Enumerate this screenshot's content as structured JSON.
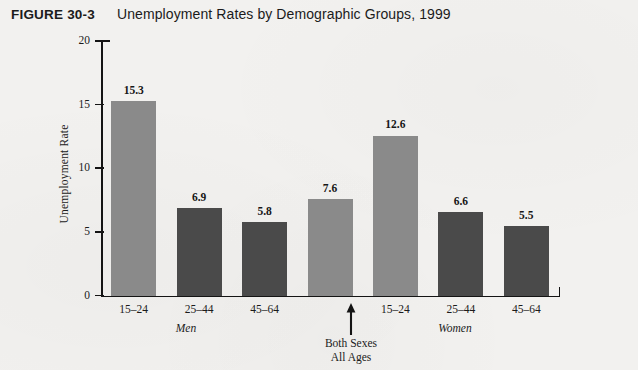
{
  "figure": {
    "number": "FIGURE 30-3",
    "title": "Unemployment Rates by Demographic Groups, 1999"
  },
  "colors": {
    "bar_light": "#8a8a8a",
    "bar_dark": "#4a4a4a",
    "axis": "#141414",
    "background": "#f2f1ef",
    "text": "#1b1b1b"
  },
  "chart_data": {
    "type": "bar",
    "title": "Unemployment Rates by Demographic Groups, 1999",
    "xlabel": "",
    "ylabel": "Unemployment Rate",
    "ylim": [
      0,
      20
    ],
    "yticks": [
      0,
      5,
      10,
      15,
      20
    ],
    "ytick_labels": [
      "0",
      "5",
      "10",
      "15",
      "20"
    ],
    "grid": false,
    "legend": "none",
    "categories": [
      "15–24",
      "25–44",
      "45–64",
      "All Ages",
      "15–24",
      "25–44",
      "45–64"
    ],
    "values": [
      15.3,
      6.9,
      5.8,
      7.6,
      12.6,
      6.6,
      5.5
    ],
    "value_labels": [
      "15.3",
      "6.9",
      "5.8",
      "7.6",
      "12.6",
      "6.6",
      "5.5"
    ],
    "bar_colors": [
      "#8a8a8a",
      "#4a4a4a",
      "#4a4a4a",
      "#8a8a8a",
      "#8a8a8a",
      "#4a4a4a",
      "#4a4a4a"
    ],
    "groups": [
      {
        "label": "Men",
        "categories": [
          "15–24",
          "25–44",
          "45–64"
        ]
      },
      {
        "label": "Women",
        "categories": [
          "15–24",
          "25–44",
          "45–64"
        ]
      }
    ],
    "annotations": [
      {
        "text_line1": "Both Sexes",
        "text_line2": "All Ages",
        "marker": "up-arrow",
        "points_to": "All Ages"
      }
    ]
  },
  "bars": [
    {
      "label": "15–24",
      "value": 15.3,
      "value_label": "15.3",
      "color": "#8a8a8a"
    },
    {
      "label": "25–44",
      "value": 6.9,
      "value_label": "6.9",
      "color": "#4a4a4a"
    },
    {
      "label": "45–64",
      "value": 5.8,
      "value_label": "5.8",
      "color": "#4a4a4a"
    },
    {
      "label": "All Ages",
      "value": 7.6,
      "value_label": "7.6",
      "color": "#8a8a8a"
    },
    {
      "label": "15–24",
      "value": 12.6,
      "value_label": "12.6",
      "color": "#8a8a8a"
    },
    {
      "label": "25–44",
      "value": 6.6,
      "value_label": "6.6",
      "color": "#4a4a4a"
    },
    {
      "label": "45–64",
      "value": 5.5,
      "value_label": "5.5",
      "color": "#4a4a4a"
    }
  ],
  "axis": {
    "y_title": "Unemployment Rate",
    "y_ticks": [
      "20",
      "15",
      "10",
      "5",
      "0"
    ]
  },
  "group_labels": {
    "men": "Men",
    "women": "Women"
  },
  "annotation": {
    "line1": "Both Sexes",
    "line2": "All Ages"
  }
}
